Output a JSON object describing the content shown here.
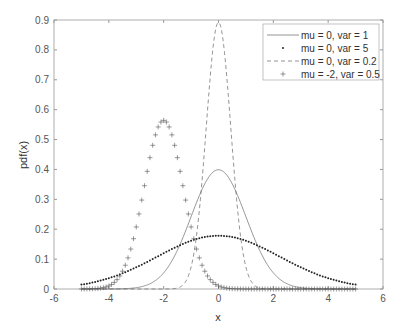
{
  "chart_data": {
    "type": "line",
    "title": "",
    "xlabel": "x",
    "ylabel": "pdf(x)",
    "xlim": [
      -6,
      6
    ],
    "ylim": [
      0,
      0.9
    ],
    "xticks": [
      -6,
      -4,
      -2,
      0,
      2,
      4,
      6
    ],
    "yticks": [
      0,
      0.1,
      0.2,
      0.3,
      0.4,
      0.5,
      0.6,
      0.7,
      0.8,
      0.9
    ],
    "xtick_labels": [
      "-6",
      "-4",
      "-2",
      "0",
      "2",
      "4",
      "6"
    ],
    "ytick_labels": [
      "0",
      "0.1",
      "0.2",
      "0.3",
      "0.4",
      "0.5",
      "0.6",
      "0.7",
      "0.8",
      "0.9"
    ],
    "grid": false,
    "legend_position": "northeast",
    "x_range_sampled": [
      -5,
      5
    ],
    "series": [
      {
        "name": "mu = 0, var = 1",
        "mu": 0,
        "var": 1,
        "style": "solid",
        "peak": 0.399
      },
      {
        "name": "mu = 0, var = 5",
        "mu": 0,
        "var": 5,
        "style": "dot",
        "peak": 0.178
      },
      {
        "name": "mu = 0, var = 0.2",
        "mu": 0,
        "var": 0.2,
        "style": "dashed",
        "peak": 0.892
      },
      {
        "name": "mu = -2, var = 0.5",
        "mu": -2,
        "var": 0.5,
        "style": "plus",
        "peak": 0.564
      }
    ]
  }
}
